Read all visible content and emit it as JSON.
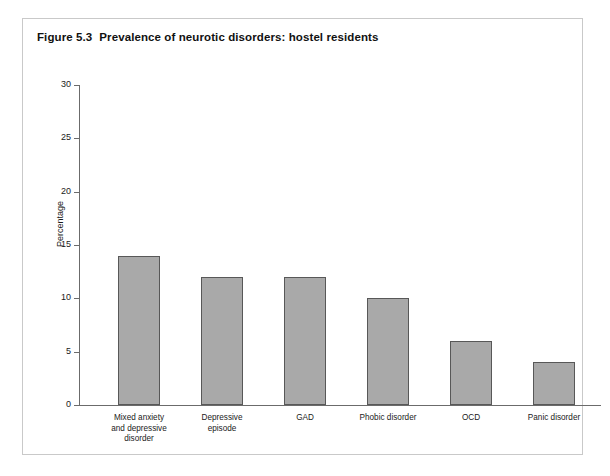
{
  "figure": {
    "number": "Figure 5.3",
    "title": "Prevalence of neurotic disorders: hostel residents"
  },
  "chart_data": {
    "type": "bar",
    "categories": [
      "Mixed anxiety\nand depressive\ndisorder",
      "Depressive\nepisode",
      "GAD",
      "Phobic disorder",
      "OCD",
      "Panic disorder"
    ],
    "values": [
      14,
      12,
      12,
      10,
      6,
      4
    ],
    "xlabel": "",
    "ylabel": "Percentage",
    "ylim": [
      0,
      30
    ],
    "yticks": [
      0,
      5,
      10,
      15,
      20,
      25,
      30
    ],
    "ytick_labels": [
      "0",
      "5",
      "10",
      "15",
      "20",
      "25",
      "30"
    ],
    "grid": false,
    "legend": false,
    "bar_color": "#a9a9a9",
    "bar_border_color": "#585858",
    "axis_color": "#6b6b6b"
  }
}
